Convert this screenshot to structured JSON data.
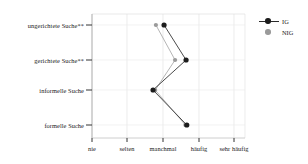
{
  "chart_data": {
    "type": "line",
    "title": "",
    "subtitle": "",
    "xlabel": "",
    "ylabel": "",
    "orientation": "horizontal",
    "categories": [
      "ungerichtete Suche**",
      "gerichtete Suche**",
      "informelle Suche",
      "formelle Suche"
    ],
    "x_tick_labels": [
      "nie",
      "selten",
      "manchmal",
      "häufig",
      "sehr häufig"
    ],
    "x_tick_values": [
      1,
      2,
      3,
      4,
      5
    ],
    "xlim": [
      0.8,
      5.3
    ],
    "grid": true,
    "legend_position": "right",
    "series": [
      {
        "name": "IG",
        "color": "#1c1c1c",
        "linestyle": "solid",
        "marker": "circle",
        "values": [
          3.03,
          3.65,
          2.72,
          3.67
        ]
      },
      {
        "name": "NIG",
        "color": "#9a9a9a",
        "linestyle": "solid",
        "marker": "circle",
        "values": [
          2.8,
          3.34,
          2.78,
          3.63
        ]
      }
    ]
  },
  "legend": {
    "items": [
      {
        "label": "IG",
        "color": "#1c1c1c"
      },
      {
        "label": "NIG",
        "color": "#9a9a9a"
      }
    ]
  },
  "axes": {
    "y_labels": [
      "ungerichtete Suche**",
      "gerichtete Suche**",
      "informelle Suche",
      "formelle Suche"
    ],
    "x_labels": [
      "nie",
      "selten",
      "manchmal",
      "häufig",
      "sehr häufig"
    ]
  }
}
